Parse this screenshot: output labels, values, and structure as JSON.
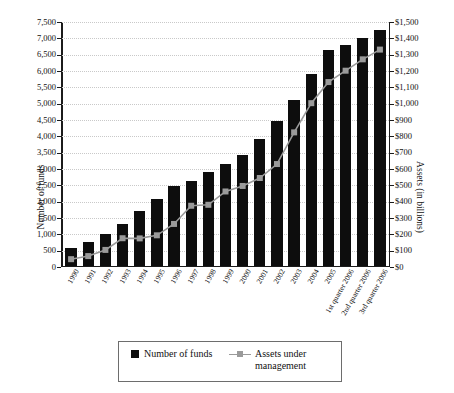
{
  "chart_data": {
    "type": "bar",
    "title": "",
    "subtitle": "",
    "xlabel": "",
    "ylabel": "Number of funds",
    "y2label": "Assets (in billions)",
    "grid": true,
    "legend_position": "bottom",
    "categories": [
      "1990",
      "1991",
      "1992",
      "1993",
      "1994",
      "1995",
      "1996",
      "1997",
      "1998",
      "1999",
      "2000",
      "2001",
      "2002",
      "2003",
      "2004",
      "2005",
      "1st quarter 2006",
      "2nd quarter 2006",
      "3rd quarter 2006"
    ],
    "ylim": [
      0,
      7500
    ],
    "y2lim": [
      0,
      1500
    ],
    "yticks": [
      "0",
      "500",
      "1,000",
      "1,500",
      "2,000",
      "2,500",
      "3,000",
      "3,500",
      "4,000",
      "4,500",
      "5,000",
      "5,500",
      "6,000",
      "6,500",
      "7,000",
      "7,500"
    ],
    "y2ticks": [
      "$0",
      "$100",
      "$200",
      "$300",
      "$400",
      "$500",
      "$600",
      "$700",
      "$800",
      "$900",
      "$1,000",
      "$1,100",
      "$1,200",
      "$1,300",
      "$1,400",
      "$1,500"
    ],
    "series": [
      {
        "name": "Number of funds",
        "type": "bar",
        "axis": "left",
        "color": "#0d0d0d",
        "values": [
          540,
          730,
          970,
          1290,
          1680,
          2060,
          2450,
          2600,
          2880,
          3130,
          3400,
          3900,
          4450,
          5100,
          5900,
          6650,
          6800,
          7000,
          7250
        ]
      },
      {
        "name": "Assets under management",
        "type": "line",
        "axis": "right",
        "color": "#9a9a9a",
        "values": [
          39,
          58,
          96,
          168,
          167,
          186,
          256,
          368,
          374,
          456,
          490,
          539,
          625,
          820,
          1000,
          1130,
          1200,
          1270,
          1330
        ]
      }
    ]
  },
  "legend": {
    "items": [
      {
        "label": "Number of funds",
        "marker": "filled-square"
      },
      {
        "label": "Assets under management",
        "marker": "line-square"
      }
    ]
  }
}
